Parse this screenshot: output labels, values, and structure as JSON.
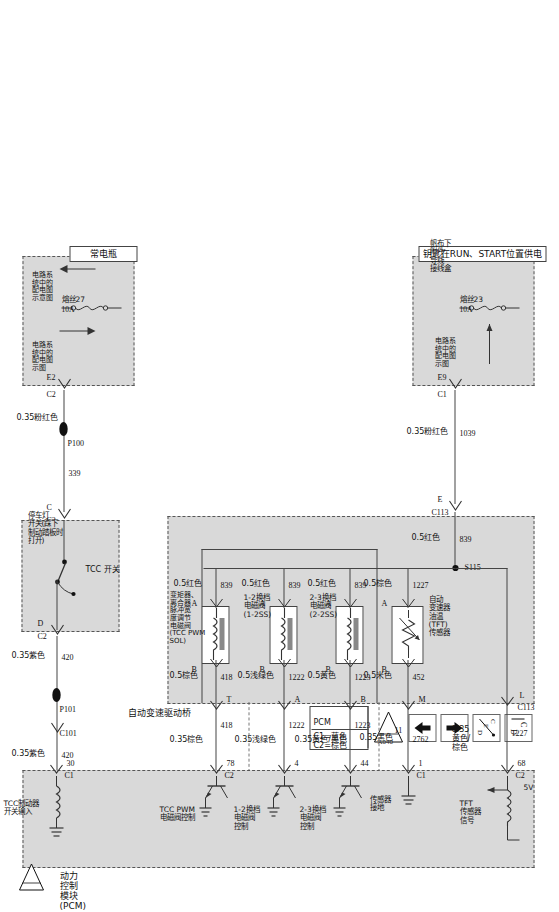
{
  "document": {
    "title": "自动变速驱动桥控制电路图",
    "legend": {
      "pcm_note_title": "PCM",
      "pcm_note_line1": "C1=蓝色",
      "pcm_note_line2": "C2=棕色",
      "icons": [
        {
          "name": "cd-icon",
          "label": "C D"
        },
        {
          "name": "de-c-icon",
          "label": "D E C"
        },
        {
          "name": "up-arrow-icon",
          "label": "▲"
        },
        {
          "name": "down-arrow-icon",
          "label": "▼"
        },
        {
          "name": "page-ref-icon",
          "label": "11"
        }
      ],
      "page_ref_number": "11",
      "page_ref_sub": "A040"
    }
  },
  "power_sources": {
    "run_start": {
      "title": "钥匙在RUN、START位置供电",
      "fuse_label": "熔丝23",
      "fuse_rating": "10A",
      "ref_note": "电路系统中的配电图示图",
      "junction_note": "帆布下附件导线接线盒",
      "connector": "C1",
      "cavity": "E9",
      "wire_number": "1039",
      "wire_spec": "0.35粉红色"
    },
    "battery": {
      "title": "常电瓶",
      "fuse_label": "熔丝27",
      "fuse_rating": "10A",
      "ref_note_left": "电路系统中的配电图示图",
      "ref_note_right": "电路系统中的配电图示图",
      "connector": "C2",
      "cavity": "E2",
      "wire_number": "339",
      "wire_spec": "0.35粉红色"
    }
  },
  "transaxle": {
    "title": "自动变速驱动桥",
    "connector": "C113",
    "splice": "S115",
    "feed_wire_number": "839",
    "feed_wire_spec": "0.5红色",
    "components": [
      {
        "name": "自动变速器油温 (TFT) 传感器",
        "pin_a": "A",
        "pin_b": "B",
        "in_wire_number": "1227",
        "in_wire_spec": "0.5棕色",
        "out_wire_number": "452",
        "out_wire_spec": "0.5米色",
        "cavity_out": "M",
        "type": "thermistor"
      },
      {
        "name": "2-3换档电磁阀 (2-2SS)",
        "pin_a": "A",
        "pin_b": "B",
        "in_wire_number": "839",
        "in_wire_spec": "0.5红色",
        "out_wire_number": "1223",
        "out_wire_spec": "0.5黄色",
        "cavity_out": "B",
        "type": "solenoid"
      },
      {
        "name": "1-2换档电磁阀 (1-2SS)",
        "pin_a": "A",
        "pin_b": "B",
        "in_wire_number": "839",
        "in_wire_spec": "0.5红色",
        "out_wire_number": "1222",
        "out_wire_spec": "0.5浅绿色",
        "cavity_out": "A",
        "type": "solenoid"
      },
      {
        "name": "变矩器、离合器脉冲宽度调节电磁阀 (TCC PWM SOL)",
        "pin_a": "A",
        "pin_b": "B",
        "in_wire_number": "839",
        "in_wire_spec": "0.5红色",
        "out_wire_number": "418",
        "out_wire_spec": "0.5棕色",
        "cavity_out": "T",
        "type": "solenoid"
      }
    ],
    "top_cavity": "L",
    "tft_feed_cavity": "E"
  },
  "brake_switch": {
    "title": "停车灯开关(踩下制动踏板时打开)",
    "inner_label": "TCC 开关",
    "in_connector": "C2",
    "in_cavity": "C",
    "out_connector": "C2",
    "out_cavity": "D",
    "in_wire_number": "339",
    "out_wire_number": "420",
    "out_wire_spec": "0.35紫色",
    "junction_connector": "C101",
    "junction_cavity": "P101",
    "junction_left": "P100"
  },
  "pcm": {
    "title": "动力控制模块 (PCM)",
    "pins": [
      {
        "pin": "68",
        "connector": "C2",
        "function": "TFT 传感器信号",
        "extra": "5V",
        "wire_number": "1227",
        "wire_spec": "0.35 黄色/棕色"
      },
      {
        "pin": "1",
        "connector": "C1",
        "function": "传感器接地",
        "wire_number": "2762",
        "wire_spec": "0.35黑色"
      },
      {
        "pin": "44",
        "connector": "",
        "function": "2-3换档电磁阀控制",
        "wire_number": "1223",
        "wire_spec": "0.35黄色/黑色"
      },
      {
        "pin": "4",
        "connector": "",
        "function": "1-2换档电磁阀控制",
        "wire_number": "1222",
        "wire_spec": "0.35浅绿色"
      },
      {
        "pin": "78",
        "connector": "C2",
        "function": "TCC PWM 电磁阀控制",
        "wire_number": "418",
        "wire_spec": "0.35棕色"
      },
      {
        "pin": "30",
        "connector": "C1",
        "function": "TCC制动器开关输入",
        "wire_number": "420",
        "wire_spec": "0.35紫色"
      }
    ]
  }
}
